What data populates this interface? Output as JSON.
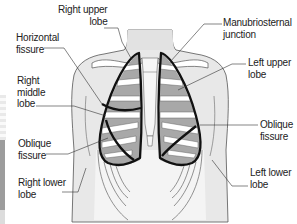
{
  "diagram": {
    "colors": {
      "background": "#ffffff",
      "body_fill": "#e8e8e8",
      "lung_fill": "#a8a8a8",
      "rib_fill": "#ffffff",
      "lobe_outline": "#111111",
      "leader_line": "#333333",
      "label_text": "#222222"
    },
    "labels": {
      "right_upper_lobe": {
        "line1": "Right upper",
        "line2": "lobe"
      },
      "horizontal_fissure": {
        "line1": "Horizontal",
        "line2": "fissure"
      },
      "right_middle_lobe": {
        "line1": "Right",
        "line2": "middle",
        "line3": "lobe"
      },
      "oblique_fissure_right": {
        "line1": "Oblique",
        "line2": "fissure"
      },
      "right_lower_lobe": {
        "line1": "Right lower",
        "line2": "lobe"
      },
      "manubriosternal_junction": {
        "line1": "Manubriosternal",
        "line2": "junction"
      },
      "left_upper_lobe": {
        "line1": "Left upper",
        "line2": "lobe"
      },
      "oblique_fissure_left": {
        "line1": "Oblique",
        "line2": "fissure"
      },
      "left_lower_lobe": {
        "line1": "Left lower",
        "line2": "lobe"
      }
    }
  }
}
